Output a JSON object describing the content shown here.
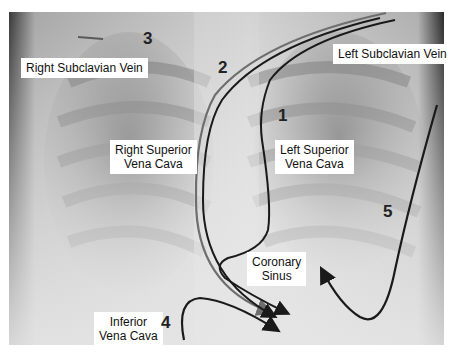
{
  "figure": {
    "labels": {
      "right_subclavian": "Right Subclavian Vein",
      "left_subclavian": "Left Subclavian Vein",
      "right_svc_line1": "Right Superior",
      "right_svc_line2": "Vena Cava",
      "left_svc_line1": "Left Superior",
      "left_svc_line2": "Vena Cava",
      "coronary_line1": "Coronary",
      "coronary_line2": "Sinus",
      "ivc_line1": "Inferior",
      "ivc_line2": "Vena Cava"
    },
    "path_numbers": {
      "p1": "1",
      "p2": "2",
      "p3": "3",
      "p4": "4",
      "p5": "5"
    },
    "colors": {
      "path_dark": "#1a1a1a",
      "path_gray": "#6e6e6e",
      "path_3": "#5a5a5a",
      "label_bg": "#ffffff"
    }
  }
}
